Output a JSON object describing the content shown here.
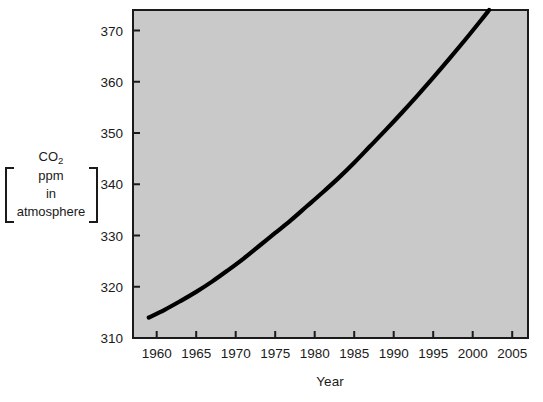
{
  "chart_data": {
    "type": "line",
    "title": "",
    "xlabel": "Year",
    "ylabel": "CO2 ppm in atmosphere",
    "ylabel_lines": [
      "CO",
      "2",
      "ppm",
      "in",
      "atmosphere"
    ],
    "xlim": [
      1957,
      2007
    ],
    "ylim": [
      310,
      374
    ],
    "grid": false,
    "legend": "none",
    "line_color": "#000000",
    "plot_background": "#c9c9c9",
    "frame_color": "#1a1a1a",
    "xticks": [
      1960,
      1965,
      1970,
      1975,
      1980,
      1985,
      1990,
      1995,
      2000,
      2005
    ],
    "xtick_labels": [
      "1960",
      "1965",
      "1970",
      "1975",
      "1980",
      "1985",
      "1990",
      "1995",
      "2000",
      "2005"
    ],
    "yticks": [
      310,
      320,
      330,
      340,
      350,
      360,
      370
    ],
    "ytick_labels": [
      "310",
      "320",
      "330",
      "340",
      "350",
      "360",
      "370"
    ],
    "series": [
      {
        "name": "Atmospheric CO2",
        "x": [
          1959,
          1961,
          1963,
          1965,
          1967,
          1969,
          1971,
          1973,
          1975,
          1977,
          1979,
          1981,
          1983,
          1985,
          1987,
          1989,
          1991,
          1993,
          1995,
          1997,
          1999,
          2001,
          2003,
          2005
        ],
        "values": [
          314.0,
          315.5,
          317.2,
          319.0,
          321.0,
          323.2,
          325.5,
          328.0,
          330.5,
          333.0,
          335.7,
          338.4,
          341.2,
          344.2,
          347.4,
          350.6,
          353.9,
          357.3,
          360.8,
          364.4,
          368.1,
          371.9,
          375.8,
          379.8
        ]
      }
    ],
    "annotations": []
  }
}
